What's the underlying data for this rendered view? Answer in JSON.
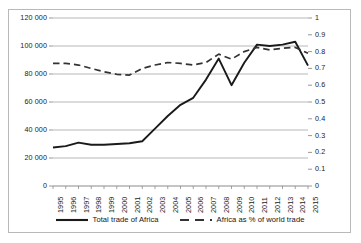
{
  "chart_data": {
    "type": "line",
    "title": "",
    "subtitle": "",
    "xlabel": "",
    "ylabel": "",
    "y2label": "",
    "grid": true,
    "legend_position": "bottom",
    "x": [
      "1995",
      "1996",
      "1997",
      "1998",
      "1999",
      "2000",
      "2001",
      "2002",
      "2003",
      "2004",
      "2005",
      "2006",
      "2007",
      "2008",
      "2009",
      "2010",
      "2011",
      "2012",
      "2013",
      "2014",
      "2015"
    ],
    "categories": [
      "1995",
      "1996",
      "1997",
      "1998",
      "1999",
      "2000",
      "2001",
      "2002",
      "2003",
      "2004",
      "2005",
      "2006",
      "2007",
      "2008",
      "2009",
      "2010",
      "2011",
      "2012",
      "2013",
      "2014",
      "2015"
    ],
    "ylim": [
      0,
      120000
    ],
    "yticks": [
      0,
      20000,
      40000,
      60000,
      80000,
      100000,
      120000
    ],
    "ytick_labels": [
      "0",
      "20 000",
      "40 000",
      "60 000",
      "80 000",
      "100 000",
      "120 000"
    ],
    "y2lim": [
      0,
      1
    ],
    "y2ticks": [
      0,
      0.1,
      0.2,
      0.3,
      0.4,
      0.5,
      0.6,
      0.7,
      0.8,
      0.9,
      1
    ],
    "y2tick_labels": [
      "0",
      "0.1",
      "0.2",
      "0.3",
      "0.4",
      "0.5",
      "0.6",
      "0.7",
      "0.8",
      "0.9",
      "1"
    ],
    "series": [
      {
        "name": "Total trade of Africa",
        "axis": "left",
        "style": "solid",
        "color": "#1a1a1a",
        "values": [
          27500,
          28500,
          31000,
          29500,
          29500,
          30000,
          30500,
          32000,
          41000,
          50000,
          58000,
          63000,
          76000,
          91000,
          72000,
          88000,
          101000,
          100000,
          101000,
          103000,
          86000
        ]
      },
      {
        "name": "Africa as % of world trade",
        "axis": "right",
        "style": "dashed",
        "color": "#333333",
        "values": [
          0.73,
          0.73,
          0.72,
          0.7,
          0.68,
          0.665,
          0.66,
          0.7,
          0.72,
          0.735,
          0.73,
          0.72,
          0.735,
          0.785,
          0.755,
          0.8,
          0.825,
          0.81,
          0.82,
          0.825,
          0.79
        ]
      }
    ]
  },
  "legend": {
    "entries": [
      {
        "label": "Total trade of Africa",
        "style": "solid"
      },
      {
        "label": "Africa as % of world trade",
        "style": "dashed"
      }
    ]
  },
  "colors": {
    "frame": "#b9b9b9",
    "gridline": "#a6a6a6",
    "series_solid": "#1a1a1a",
    "series_dashed": "#333333",
    "text": "#1a1a1a",
    "background": "#ffffff"
  }
}
